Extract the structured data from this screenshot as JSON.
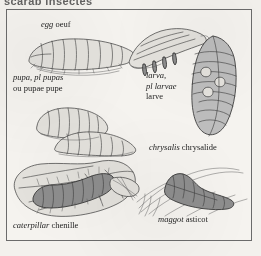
{
  "page": {
    "running_head": "scarab insectes",
    "background_color": "#f3f1ed",
    "frame_border_color": "#6b6b6b"
  },
  "plate": {
    "title": "insect life stages",
    "captions": [
      {
        "id": "egg",
        "english": "egg",
        "french": "oeuf",
        "icon": "insect-egg-grub-illustration"
      },
      {
        "id": "pupa",
        "english": "pupa, pl pupas",
        "english_alt": "ou pupae",
        "french": "pupe",
        "icon": "insect-pupa-illustration"
      },
      {
        "id": "larva",
        "english": "larva,",
        "english_alt": "pl larvae",
        "french": "larve",
        "icon": "insect-larva-illustration"
      },
      {
        "id": "chrysalis",
        "english": "chrysalis",
        "french": "chrysalide",
        "icon": "insect-chrysalis-illustration"
      },
      {
        "id": "caterpillar",
        "english": "caterpillar",
        "french": "chenille",
        "icon": "caterpillar-on-leaf-illustration"
      },
      {
        "id": "maggot",
        "english": "maggot",
        "french": "asticot",
        "icon": "maggot-illustration"
      }
    ]
  }
}
